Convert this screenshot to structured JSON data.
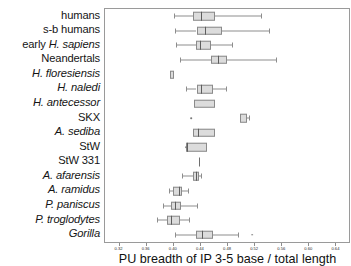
{
  "chart_data": {
    "type": "box",
    "title": "",
    "xlabel": "PU breadth of IP 3-5 base / total length",
    "ylabel": "",
    "xlim": [
      0.3,
      0.66
    ],
    "xticks": [
      0.32,
      0.36,
      0.4,
      0.44,
      0.48,
      0.52,
      0.56,
      0.6,
      0.64
    ],
    "xticklabels": [
      "0.32",
      "0.36",
      "0.40",
      "0.44",
      "0.48",
      "0.52",
      "0.56",
      "0.60",
      "0.64"
    ],
    "grid": false,
    "legend": null,
    "orientation": "horizontal",
    "categories": [
      "humans",
      "s-b humans",
      "early H. sapiens",
      "Neandertals",
      "H. floresiensis",
      "H. naledi",
      "H. antecessor",
      "SKX",
      "A. sediba",
      "StW",
      "StW 331",
      "A. afarensis",
      "A. ramidus",
      "P. paniscus",
      "P. troglodytes",
      "Gorilla"
    ],
    "boxes": [
      {
        "taxon": "humans",
        "min": 0.402,
        "q1": 0.43,
        "median": 0.442,
        "q3": 0.462,
        "max": 0.53,
        "outliers": []
      },
      {
        "taxon": "s-b humans",
        "min": 0.403,
        "q1": 0.435,
        "median": 0.448,
        "q3": 0.473,
        "max": 0.542,
        "outliers": []
      },
      {
        "taxon": "early H. sapiens",
        "min": 0.405,
        "q1": 0.434,
        "median": 0.44,
        "q3": 0.457,
        "max": 0.487,
        "outliers": []
      },
      {
        "taxon": "Neandertals",
        "min": 0.41,
        "q1": 0.456,
        "median": 0.467,
        "q3": 0.48,
        "max": 0.553,
        "outliers": []
      },
      {
        "taxon": "H. floresiensis",
        "min": 0.396,
        "q1": 0.396,
        "median": null,
        "q3": 0.402,
        "max": 0.402,
        "outliers": []
      },
      {
        "taxon": "H. naledi",
        "min": 0.42,
        "q1": 0.435,
        "median": 0.441,
        "q3": 0.459,
        "max": 0.478,
        "outliers": []
      },
      {
        "taxon": "H. antecessor",
        "min": 0.432,
        "q1": 0.432,
        "median": null,
        "q3": 0.462,
        "max": 0.462,
        "outliers": []
      },
      {
        "taxon": "SKX",
        "min": 0.499,
        "q1": 0.499,
        "median": null,
        "q3": 0.509,
        "max": 0.513,
        "outliers": [
          0.427
        ]
      },
      {
        "taxon": "A. sediba",
        "min": 0.43,
        "q1": 0.43,
        "median": 0.437,
        "q3": 0.462,
        "max": 0.462,
        "outliers": []
      },
      {
        "taxon": "StW",
        "min": 0.419,
        "q1": 0.419,
        "median": 0.421,
        "q3": 0.45,
        "max": 0.45,
        "outliers": [
          0.42
        ]
      },
      {
        "taxon": "StW 331",
        "min": null,
        "q1": null,
        "median": 0.439,
        "q3": null,
        "max": null,
        "outliers": []
      },
      {
        "taxon": "A. afarensis",
        "min": 0.414,
        "q1": 0.43,
        "median": 0.434,
        "q3": 0.438,
        "max": 0.442,
        "outliers": []
      },
      {
        "taxon": "A. ramidus",
        "min": 0.395,
        "q1": 0.401,
        "median": 0.409,
        "q3": 0.414,
        "max": 0.422,
        "outliers": []
      },
      {
        "taxon": "P. paniscus",
        "min": 0.386,
        "q1": 0.398,
        "median": 0.404,
        "q3": 0.412,
        "max": 0.436,
        "outliers": []
      },
      {
        "taxon": "P. troglodytes",
        "min": 0.377,
        "q1": 0.392,
        "median": 0.398,
        "q3": 0.41,
        "max": 0.424,
        "outliers": []
      },
      {
        "taxon": "Gorilla",
        "min": 0.404,
        "q1": 0.434,
        "median": 0.443,
        "q3": 0.459,
        "max": 0.496,
        "outliers": [
          0.517
        ]
      }
    ]
  },
  "axis": {
    "title": "PU breadth of IP 3-5 base / total length"
  },
  "labels": [
    {
      "pre": "humans",
      "it": ""
    },
    {
      "pre": "s-b humans",
      "it": ""
    },
    {
      "pre": "early ",
      "it": "H. sapiens"
    },
    {
      "pre": "Neandertals",
      "it": ""
    },
    {
      "pre": "",
      "it": "H. floresiensis"
    },
    {
      "pre": "",
      "it": "H. naledi"
    },
    {
      "pre": "",
      "it": "H. antecessor"
    },
    {
      "pre": "SKX",
      "it": ""
    },
    {
      "pre": "",
      "it": "A. sediba"
    },
    {
      "pre": "StW",
      "it": ""
    },
    {
      "pre": "StW 331",
      "it": ""
    },
    {
      "pre": "",
      "it": "A. afarensis"
    },
    {
      "pre": "",
      "it": "A. ramidus"
    },
    {
      "pre": "",
      "it": "P. paniscus"
    },
    {
      "pre": "",
      "it": "P. troglodytes"
    },
    {
      "pre": "",
      "it": "Gorilla"
    }
  ]
}
